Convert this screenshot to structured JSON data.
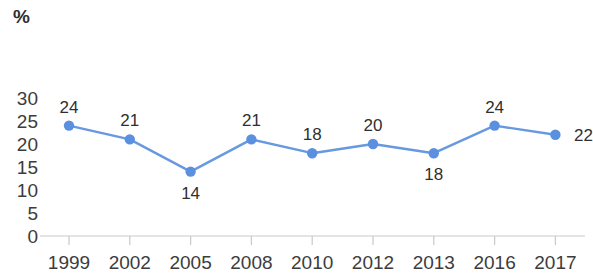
{
  "chart_data": {
    "type": "line",
    "title": "",
    "subtitle": "",
    "xlabel": "",
    "ylabel": "%",
    "categories": [
      "1999",
      "2002",
      "2005",
      "2008",
      "2010",
      "2012",
      "2013",
      "2016",
      "2017"
    ],
    "values": [
      24,
      21,
      14,
      21,
      18,
      20,
      18,
      24,
      22
    ],
    "series": [
      {
        "name": "",
        "values": [
          24,
          21,
          14,
          21,
          18,
          20,
          18,
          24,
          22
        ]
      }
    ],
    "point_labels": [
      "24",
      "21",
      "14",
      "21",
      "18",
      "20",
      "18",
      "24",
      "22"
    ],
    "point_label_positions": [
      "above",
      "above",
      "below",
      "above",
      "above",
      "above",
      "below",
      "above",
      "right"
    ],
    "ylim": [
      0,
      30
    ],
    "ytick_labels": [
      "30",
      "25",
      "20",
      "15",
      "10",
      "5",
      "0"
    ],
    "ytick_values": [
      30,
      25,
      20,
      15,
      10,
      5,
      0
    ],
    "grid": false,
    "legend": false,
    "legend_position": "none",
    "colors": {
      "line": "#6699e0",
      "marker": "#5b90e0",
      "axis": "#c9c9c9",
      "text": "#3c3c3c"
    }
  },
  "axis": {
    "unit_label": "%"
  }
}
